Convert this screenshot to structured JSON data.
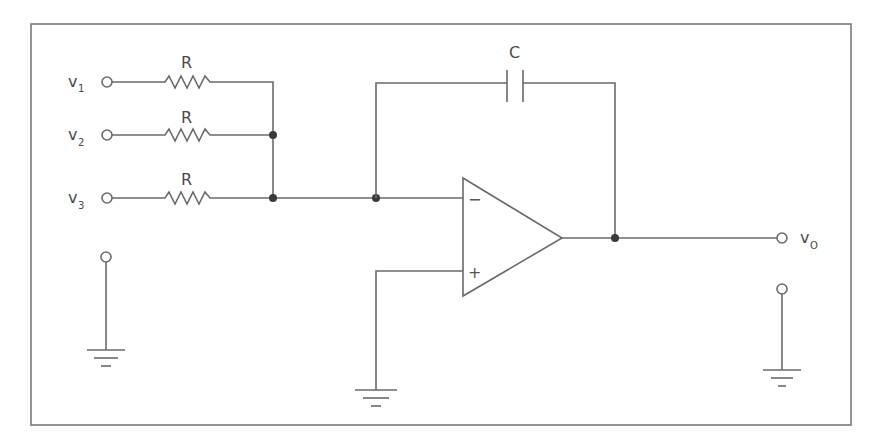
{
  "diagram": {
    "type": "op-amp summing integrator circuit",
    "inputs": [
      {
        "label": "v",
        "subscript": "1",
        "resistor": "R"
      },
      {
        "label": "v",
        "subscript": "2",
        "resistor": "R"
      },
      {
        "label": "v",
        "subscript": "3",
        "resistor": "R"
      }
    ],
    "capacitor": {
      "label": "C"
    },
    "opamp": {
      "inverting": "−",
      "noninverting": "+"
    },
    "output": {
      "label": "v",
      "subscript": "O"
    }
  }
}
